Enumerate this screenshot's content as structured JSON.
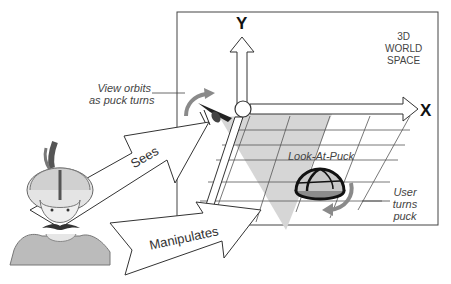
{
  "diagram": {
    "world_label": [
      "3D",
      "WORLD",
      "SPACE"
    ],
    "axes": {
      "y": "Y",
      "x": "X"
    },
    "technique_label": "Look-At-Puck",
    "annotations": {
      "view_orbits": [
        "View orbits",
        "as puck turns"
      ],
      "user_turns": [
        "User",
        "turns",
        "puck"
      ]
    },
    "arrows": {
      "sees": "Sees",
      "manipulates": "Manipulates"
    },
    "colors": {
      "line": "#333333",
      "frustum": "#d9d9d9",
      "orbit_arrow": "#8a8a8a",
      "puck_base": "#8c8c8c",
      "puck_dome": "#c8c8c8"
    }
  }
}
